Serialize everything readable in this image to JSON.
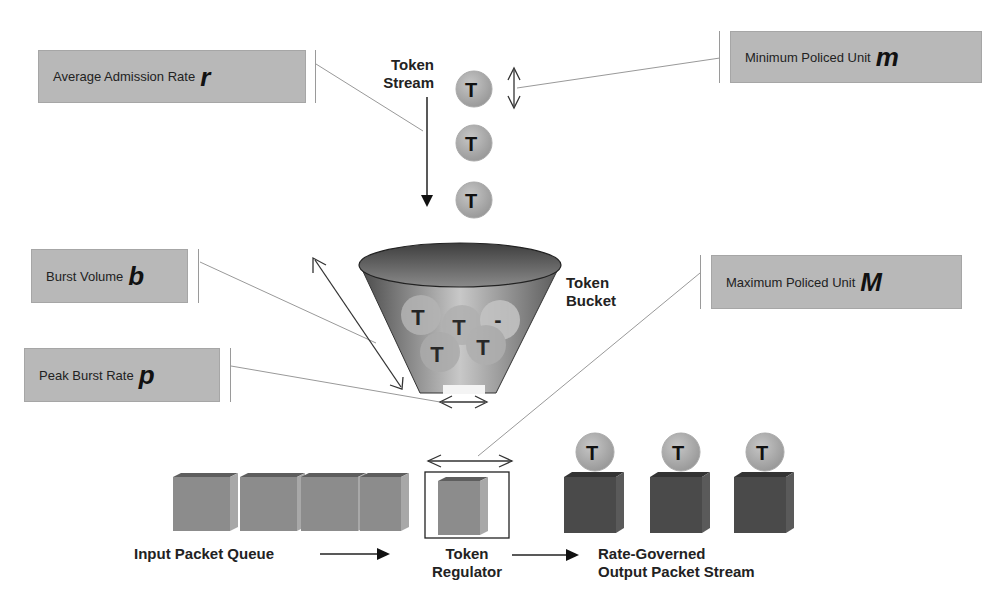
{
  "labels": {
    "average_admission_rate": {
      "text": "Average Admission  Rate",
      "var": "r"
    },
    "minimum_policed_unit": {
      "text": "Minimum Policed Unit",
      "var": "m"
    },
    "burst_volume": {
      "text": "Burst Volume",
      "var": "b"
    },
    "peak_burst_rate": {
      "text": "Peak Burst Rate",
      "var": "p"
    },
    "maximum_policed_unit": {
      "text": "Maximum Policed Unit",
      "var": "M"
    }
  },
  "captions": {
    "token_stream": [
      "Token",
      "Stream"
    ],
    "token_bucket": [
      "Token",
      "Bucket"
    ],
    "input_packet_queue": "Input Packet Queue",
    "token_regulator": [
      "Token",
      "Regulator"
    ],
    "output_stream": [
      "Rate-Governed",
      "Output Packet Stream"
    ]
  },
  "token_glyph": "T",
  "colors": {
    "label_fill": "#b8b8b8",
    "token": "#a8a8a8",
    "input_packet": "#8c8c8c",
    "output_packet": "#4a4a4a",
    "bucket_dark": "#555555",
    "bucket_light": "#d8d8d8"
  }
}
